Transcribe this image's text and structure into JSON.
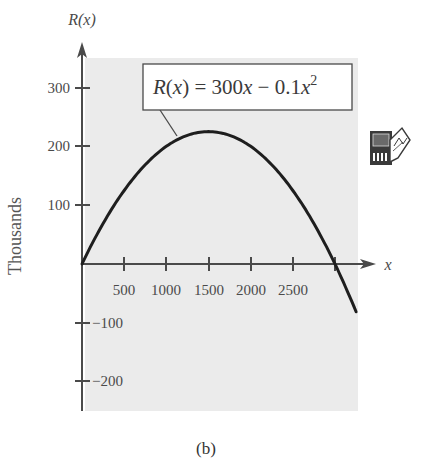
{
  "chart_data": {
    "type": "line",
    "title": "",
    "function": "R(x) = 300x - 0.1x^2",
    "annotation": {
      "prefix": "R(x) = 300x − 0.1x",
      "superscript": "2"
    },
    "xlabel": "x",
    "ylabel_axis": "R(x)",
    "ylabel_side": "Thousands",
    "caption": "(b)",
    "xlim": [
      0,
      3300
    ],
    "ylim": [
      -250,
      350
    ],
    "x_ticks": [
      500,
      1000,
      1500,
      2000,
      2500,
      3000
    ],
    "x_tick_labels": [
      "500",
      "1000",
      "1500",
      "2000",
      "2500"
    ],
    "y_ticks": [
      300,
      200,
      100,
      -100,
      -200
    ],
    "y_tick_labels": [
      "300",
      "200",
      "100",
      "−100",
      "−200"
    ],
    "series": [
      {
        "name": "R(x)",
        "x": [
          0,
          250,
          500,
          750,
          1000,
          1250,
          1500,
          1750,
          2000,
          2250,
          2500,
          2750,
          3000,
          3250
        ],
        "values": [
          0,
          68.75,
          125,
          168.75,
          200,
          218.75,
          225,
          218.75,
          200,
          168.75,
          125,
          68.75,
          0,
          -81.25
        ]
      }
    ],
    "grid": false,
    "legend": "none",
    "background": "#ebebeb",
    "curve_color": "#1e1e1e",
    "axis_color": "#4a4a4a"
  },
  "icon": {
    "name": "graphing-calculator-icon"
  }
}
